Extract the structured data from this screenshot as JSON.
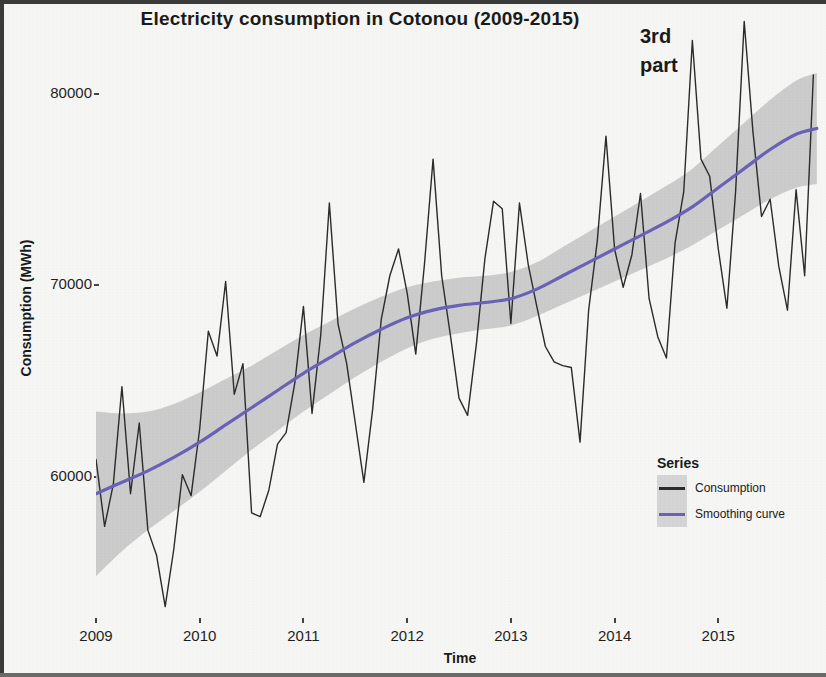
{
  "chart_data": {
    "type": "line",
    "title": "Electricity consumption in Cotonou (2009-2015)",
    "xlabel": "Time",
    "ylabel": "Consumption (MWh)",
    "annotation": "3rd\npart",
    "annotation_line1": "3rd",
    "annotation_line2": "part",
    "grid": false,
    "legend_position": "bottom-right",
    "legend_title": "Series",
    "xlim": [
      2009.0,
      2016.0
    ],
    "ylim": [
      52500,
      84500
    ],
    "yticks": [
      60000,
      70000,
      80000
    ],
    "ytick_labels": [
      "60000",
      "70000",
      "80000"
    ],
    "xticks": [
      2009,
      2010,
      2011,
      2012,
      2013,
      2014,
      2015
    ],
    "xtick_labels": [
      "2009",
      "2010",
      "2011",
      "2012",
      "2013",
      "2014",
      "2015"
    ],
    "colors": {
      "consumption": "#2b2b2b",
      "smoothing_curve": "#6a62b8",
      "confidence_band": "#c9c9c9",
      "panel": "#f7f7f5",
      "text": "#1a1a1a"
    },
    "series": [
      {
        "name": "Consumption",
        "type": "line",
        "color": "#2b2b2b",
        "x": [
          2009.0,
          2009.083,
          2009.167,
          2009.25,
          2009.333,
          2009.417,
          2009.5,
          2009.583,
          2009.667,
          2009.75,
          2009.833,
          2009.917,
          2010.0,
          2010.083,
          2010.167,
          2010.25,
          2010.333,
          2010.417,
          2010.5,
          2010.583,
          2010.667,
          2010.75,
          2010.833,
          2010.917,
          2011.0,
          2011.083,
          2011.167,
          2011.25,
          2011.333,
          2011.417,
          2011.5,
          2011.583,
          2011.667,
          2011.75,
          2011.833,
          2011.917,
          2012.0,
          2012.083,
          2012.167,
          2012.25,
          2012.333,
          2012.417,
          2012.5,
          2012.583,
          2012.667,
          2012.75,
          2012.833,
          2012.917,
          2013.0,
          2013.083,
          2013.167,
          2013.25,
          2013.333,
          2013.417,
          2013.5,
          2013.583,
          2013.667,
          2013.75,
          2013.833,
          2013.917,
          2014.0,
          2014.083,
          2014.167,
          2014.25,
          2014.333,
          2014.417,
          2014.5,
          2014.583,
          2014.667,
          2014.75,
          2014.833,
          2014.917,
          2015.0,
          2015.083,
          2015.167,
          2015.25,
          2015.333,
          2015.417,
          2015.5,
          2015.583,
          2015.667,
          2015.75,
          2015.833,
          2015.917
        ],
        "values": [
          60900,
          57400,
          59600,
          64700,
          59100,
          62800,
          57200,
          55900,
          53200,
          56200,
          60100,
          59000,
          62500,
          67600,
          66300,
          70200,
          64300,
          65900,
          58100,
          57900,
          59300,
          61700,
          62300,
          64900,
          68900,
          63300,
          67400,
          74300,
          68000,
          65900,
          62800,
          59700,
          63500,
          68200,
          70500,
          71900,
          69600,
          66400,
          71100,
          76600,
          70500,
          67400,
          64100,
          63200,
          66900,
          71400,
          74400,
          74000,
          68000,
          74300,
          71100,
          68900,
          66800,
          66000,
          65800,
          65700,
          61800,
          68700,
          72300,
          77800,
          71900,
          69900,
          71600,
          74800,
          69300,
          67300,
          66200,
          72200,
          74900,
          82800,
          76600,
          75700,
          71900,
          68800,
          74900,
          83800,
          78100,
          73600,
          74500,
          71000,
          68700,
          75000,
          70500,
          81000
        ]
      },
      {
        "name": "Smoothing curve",
        "type": "line",
        "color": "#6a62b8",
        "x": [
          2009.0,
          2009.25,
          2009.5,
          2009.75,
          2010.0,
          2010.25,
          2010.5,
          2010.75,
          2011.0,
          2011.25,
          2011.5,
          2011.75,
          2012.0,
          2012.25,
          2012.5,
          2012.75,
          2013.0,
          2013.25,
          2013.5,
          2013.75,
          2014.0,
          2014.25,
          2014.5,
          2014.75,
          2015.0,
          2015.25,
          2015.5,
          2015.75,
          2015.95
        ],
        "values": [
          59100,
          59700,
          60300,
          61000,
          61800,
          62700,
          63600,
          64500,
          65400,
          66200,
          67000,
          67700,
          68300,
          68700,
          68950,
          69100,
          69300,
          69800,
          70500,
          71200,
          71900,
          72600,
          73300,
          74100,
          75100,
          76100,
          77100,
          77900,
          78200
        ],
        "band_lower": [
          54800,
          56100,
          57200,
          58200,
          59200,
          60300,
          61400,
          62400,
          63400,
          64300,
          65200,
          66000,
          66700,
          67200,
          67500,
          67700,
          67900,
          68400,
          69000,
          69600,
          70200,
          70800,
          71400,
          72100,
          72900,
          73700,
          74500,
          75100,
          75300
        ],
        "band_upper": [
          63400,
          63300,
          63400,
          63800,
          64400,
          65100,
          65800,
          66600,
          67400,
          68100,
          68800,
          69400,
          69900,
          70200,
          70400,
          70500,
          70700,
          71200,
          72000,
          72800,
          73600,
          74400,
          75200,
          76100,
          77300,
          78500,
          79700,
          80700,
          81100
        ]
      }
    ]
  },
  "legend": {
    "title": "Series",
    "items": [
      {
        "label": "Consumption",
        "color": "#2b2b2b"
      },
      {
        "label": "Smoothing curve",
        "color": "#6a62b8"
      }
    ]
  }
}
